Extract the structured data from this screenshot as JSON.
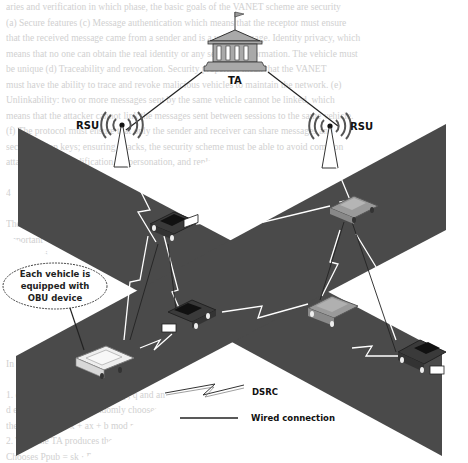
{
  "figure": {
    "nodes": {
      "ta": {
        "label": "TA",
        "icon": "government-building-icon"
      },
      "rsu_left": {
        "label": "RSU",
        "icon": "radio-tower-icon"
      },
      "rsu_right": {
        "label": "RSU",
        "icon": "radio-tower-icon"
      }
    },
    "callout": {
      "line1": "Each vehicle is",
      "line2": "equipped with",
      "line3": "OBU device"
    },
    "legend": {
      "dsrc": {
        "label": "DSRC",
        "symbol": "lightning-link"
      },
      "wired": {
        "label": "Wired connection",
        "symbol": "solid-line"
      }
    },
    "vehicles": [
      {
        "id": "v1",
        "shade": "dark",
        "position": "upper-left-road"
      },
      {
        "id": "v2",
        "shade": "light-gray",
        "position": "upper-right-road"
      },
      {
        "id": "v3",
        "shade": "dark",
        "position": "center-left"
      },
      {
        "id": "v4",
        "shade": "gray",
        "position": "center-right"
      },
      {
        "id": "v5",
        "shade": "white",
        "position": "lower-left"
      },
      {
        "id": "v6",
        "shade": "dark",
        "position": "lower-right"
      }
    ],
    "colors": {
      "road": "#4a4a4a",
      "background": "#ffffff",
      "building": "#a9a9a9",
      "link_white": "#ffffff",
      "wire": "#222222"
    }
  },
  "background_text": {
    "lines": [
      "aries and verification in which phase, the basic goals of the VANET scheme are security",
      "(a) Secure features (c) Message authentication which means that the receptor must ensure",
      "that the received message came from a sender and is a valid message. Identity privacy, which",
      "means that no one can obtain the real identity or any sensitive information. The vehicle must",
      "be unique (d) Traceability and revocation. Security properties mean that the VANET",
      "must have the ability to trace and revoke malicious vehicles to maintain the network. (e)",
      "Unlinkability: two or more messages sent by the same vehicle cannot be linked, which",
      "means that the attacker cannot link the messages sent between sessions to the same vehicle.",
      "(f) The protocol must ensure that only the sender and receiver can share messages and",
      "secret session keys; ensuring attacks, the security scheme must be able to avoid common",
      "attacks such as modification, impersonation, and replay attacks.",
      "",
      "4",
      "",
      "The",
      "important",
      "Limited wi",
      "VANET net",
      "Table 1 shows",
      "",
      "",
      "4.1",
      "",
      "In th                                      ate the initial sys",
      "",
      "1.                        es two large prime numbers p, q and an",
      "                        d equation E. The TA randomly chooses on the elliptic",
      "             the equation  y = x + ax + b mod p, where a, b ∈ Fp",
      "2.  Then the TA produces the system private and public keys  sk, PK as follows",
      "      Chooses Ppub = sk · P as a system public key. The public key PK = (Ppub)"
    ]
  }
}
